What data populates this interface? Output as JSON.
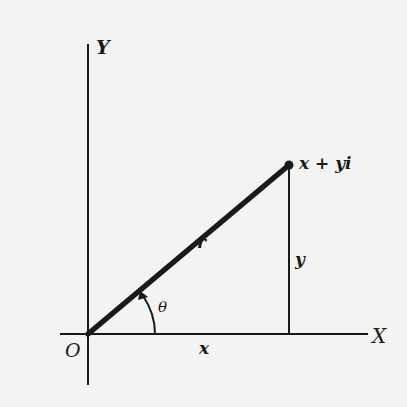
{
  "diagram": {
    "labels": {
      "y_axis": "Y",
      "x_axis": "X",
      "origin": "O",
      "radius": "r",
      "angle": "θ",
      "x_component": "x",
      "y_component": "y",
      "point": "x + yi"
    },
    "colors": {
      "ink": "#1a1a1a",
      "background": "#f3f3f1"
    },
    "geometry": {
      "origin": [
        88,
        334
      ],
      "point": [
        289,
        165
      ],
      "x_axis": {
        "from": [
          60,
          334
        ],
        "to": [
          368,
          334
        ]
      },
      "y_axis": {
        "from": [
          88,
          44
        ],
        "to": [
          88,
          385
        ]
      },
      "angle_arc_radius": 67
    }
  }
}
